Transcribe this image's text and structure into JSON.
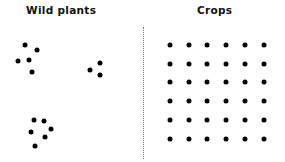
{
  "labels": {
    "left": "Wild plants",
    "right": "Crops"
  },
  "colors": {
    "dot": "#000000",
    "divider": "#777777"
  },
  "wild_plants": {
    "clusters": [
      {
        "dots": [
          [
            25,
            45
          ],
          [
            37,
            50
          ],
          [
            18,
            61
          ],
          [
            29,
            60
          ],
          [
            32,
            72
          ]
        ]
      },
      {
        "dots": [
          [
            100,
            63
          ],
          [
            90,
            70
          ],
          [
            100,
            75
          ]
        ]
      },
      {
        "dots": [
          [
            34,
            120
          ],
          [
            44,
            121
          ],
          [
            51,
            129
          ],
          [
            31,
            132
          ],
          [
            45,
            137
          ],
          [
            35,
            146
          ]
        ]
      }
    ]
  },
  "crops": {
    "rows": 6,
    "cols": 6,
    "x": [
      170,
      189,
      207,
      226,
      245,
      264
    ],
    "y": [
      45,
      64,
      82,
      101,
      120,
      139
    ]
  }
}
